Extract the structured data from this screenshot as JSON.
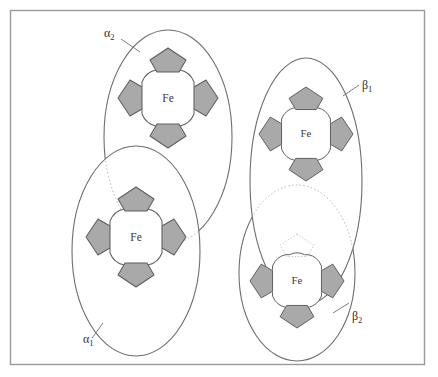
{
  "figure": {
    "width": 438,
    "height": 377,
    "background_color": "#ffffff",
    "frame": {
      "x": 10,
      "y": 10,
      "width": 415,
      "height": 355,
      "stroke_color": "#9a9a9a"
    }
  },
  "style": {
    "pyrrole_fill": "#a9a9a9",
    "pyrrole_stroke": "#5e5e5e",
    "ring_fill": "#ffffff",
    "ring_stroke": "#5e5e5e",
    "ellipse_stroke": "#6d6d6d",
    "hidden_stroke": "#b6b6b6",
    "label_color": "#2e2e2e",
    "fe_label_color": "#3a3a3a"
  },
  "subunits": [
    {
      "id": "alpha2",
      "label_base": "α",
      "label_sub": "2",
      "label_text": "α2",
      "chain_type": "alpha",
      "ellipse": {
        "cx": 168,
        "cy": 137,
        "rx": 64,
        "ry": 107
      },
      "heme": {
        "cx": 168,
        "cy": 98,
        "scale": 1.0,
        "occluded_pyrrole": null
      },
      "fe_label": "Fe",
      "label_pos": {
        "x": 104,
        "y": 37
      },
      "leader": {
        "x1": 121,
        "y1": 39,
        "x2": 140,
        "y2": 52
      },
      "z_order": 1
    },
    {
      "id": "alpha1",
      "label_base": "α",
      "label_sub": "1",
      "label_text": "α1",
      "chain_type": "alpha",
      "ellipse": {
        "cx": 136,
        "cy": 251,
        "rx": 64,
        "ry": 105
      },
      "heme": {
        "cx": 136,
        "cy": 237,
        "scale": 1.0,
        "occluded_pyrrole": null
      },
      "fe_label": "Fe",
      "label_pos": {
        "x": 83,
        "y": 343
      },
      "leader": {
        "x1": 92,
        "y1": 338,
        "x2": 103,
        "y2": 323
      },
      "z_order": 2
    },
    {
      "id": "beta1",
      "label_base": "β",
      "label_sub": "1",
      "label_text": "β1",
      "chain_type": "beta",
      "ellipse": {
        "cx": 306,
        "cy": 181,
        "rx": 56,
        "ry": 123
      },
      "heme": {
        "cx": 306,
        "cy": 134,
        "scale": 0.94,
        "occluded_pyrrole": null
      },
      "fe_label": "Fe",
      "label_pos": {
        "x": 362,
        "y": 89
      },
      "leader": {
        "x1": 343,
        "y1": 96,
        "x2": 359,
        "y2": 85
      },
      "z_order": 3
    },
    {
      "id": "beta2",
      "label_base": "β",
      "label_sub": "2",
      "label_text": "β2",
      "chain_type": "beta",
      "ellipse": {
        "cx": 297,
        "cy": 273,
        "rx": 58,
        "ry": 88
      },
      "heme": {
        "cx": 297,
        "cy": 281,
        "scale": 0.94,
        "occluded_pyrrole": "top"
      },
      "fe_label": "Fe",
      "label_pos": {
        "x": 352,
        "y": 320
      },
      "leader": {
        "x1": 333,
        "y1": 313,
        "x2": 349,
        "y2": 303
      },
      "z_order": 4
    }
  ],
  "annotations": {
    "iron_atom_label": "Fe",
    "pyrrole_count_per_heme": 4,
    "subunit_count": 4,
    "heme_description": "porphyrin macrocycle with four pyrrole rings surrounding a central iron atom"
  }
}
